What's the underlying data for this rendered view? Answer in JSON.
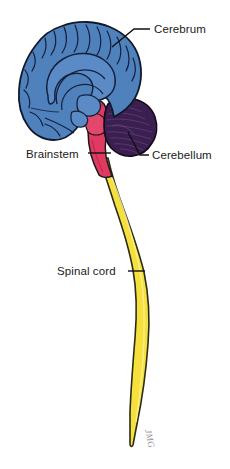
{
  "figure": {
    "background_color": "#ffffff",
    "signature": "JMG"
  },
  "colors": {
    "cerebrum_fill": "#4f81bd",
    "cerebrum_shade": "#3f6da8",
    "cerebrum_outline": "#12182b",
    "cerebellum_fill": "#3b1f50",
    "cerebellum_outline": "#140a1c",
    "brainstem_fill": "#e03a62",
    "brainstem_outline": "#1a1a1a",
    "spinal_cord_fill": "#f6e03c",
    "spinal_cord_outline": "#2b2b18",
    "label_text": "#1a1a1a",
    "leader_line": "#111111",
    "signature_color": "#8d8d8d"
  },
  "labels": [
    {
      "id": "cerebrum",
      "text": "Cerebrum",
      "text_x": 154,
      "text_y": 33,
      "leader": "M150,29 L134,29 L112,47"
    },
    {
      "id": "brainstem",
      "text": "Brainstem",
      "text_x": 26,
      "text_y": 158,
      "leader": "M88,153 L111,153"
    },
    {
      "id": "cerebellum",
      "text": "Cerebellum",
      "text_x": 152,
      "text_y": 159,
      "leader": "M149,155 L140,155 L128,132"
    },
    {
      "id": "spinal-cord",
      "text": "Spinal cord",
      "text_x": 57,
      "text_y": 275,
      "leader": "M128,271 L145,271"
    }
  ],
  "structures": [
    {
      "id": "cerebrum",
      "name": "Cerebrum",
      "color": "#4f81bd"
    },
    {
      "id": "cerebellum",
      "name": "Cerebellum",
      "color": "#3b1f50"
    },
    {
      "id": "brainstem",
      "name": "Brainstem",
      "color": "#e03a62"
    },
    {
      "id": "spinal-cord",
      "name": "Spinal cord",
      "color": "#f6e03c"
    }
  ]
}
